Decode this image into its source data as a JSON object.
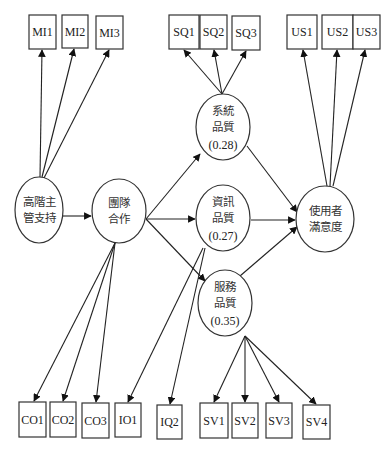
{
  "diagram": {
    "width": 390,
    "height": 453,
    "colors": {
      "stroke": "#333333",
      "text": "#222222",
      "background": "#ffffff"
    },
    "observed": [
      {
        "id": "MI1",
        "label": "MI1",
        "x": 29,
        "y": 15,
        "w": 27,
        "h": 34
      },
      {
        "id": "MI2",
        "label": "MI2",
        "x": 62,
        "y": 15,
        "w": 26,
        "h": 33
      },
      {
        "id": "MI3",
        "label": "MI3",
        "x": 96,
        "y": 16,
        "w": 27,
        "h": 33
      },
      {
        "id": "SQ1",
        "label": "SQ1",
        "x": 169,
        "y": 15,
        "w": 30,
        "h": 34
      },
      {
        "id": "SQ2",
        "label": "SQ2",
        "x": 200,
        "y": 15,
        "w": 27,
        "h": 34
      },
      {
        "id": "SQ3",
        "label": "SQ3",
        "x": 232,
        "y": 16,
        "w": 28,
        "h": 34
      },
      {
        "id": "US1",
        "label": "US1",
        "x": 287,
        "y": 15,
        "w": 30,
        "h": 34
      },
      {
        "id": "US2",
        "label": "US2",
        "x": 322,
        "y": 15,
        "w": 31,
        "h": 34
      },
      {
        "id": "US3",
        "label": "US3",
        "x": 353,
        "y": 15,
        "w": 27,
        "h": 34
      },
      {
        "id": "CO1",
        "label": "CO1",
        "x": 19,
        "y": 402,
        "w": 27,
        "h": 35
      },
      {
        "id": "CO2",
        "label": "CO2",
        "x": 50,
        "y": 402,
        "w": 26,
        "h": 35
      },
      {
        "id": "CO3",
        "label": "CO3",
        "x": 82,
        "y": 403,
        "w": 27,
        "h": 35
      },
      {
        "id": "IO1",
        "label": "IO1",
        "x": 115,
        "y": 403,
        "w": 26,
        "h": 34
      },
      {
        "id": "IQ2",
        "label": "IQ2",
        "x": 157,
        "y": 405,
        "w": 25,
        "h": 34
      },
      {
        "id": "SV1",
        "label": "SV1",
        "x": 200,
        "y": 403,
        "w": 28,
        "h": 35
      },
      {
        "id": "SV2",
        "label": "SV2",
        "x": 232,
        "y": 403,
        "w": 26,
        "h": 35
      },
      {
        "id": "SV3",
        "label": "SV3",
        "x": 266,
        "y": 403,
        "w": 26,
        "h": 35
      },
      {
        "id": "SV4",
        "label": "SV4",
        "x": 303,
        "y": 405,
        "w": 27,
        "h": 34
      }
    ],
    "latent": [
      {
        "id": "top_mgmt",
        "lines": [
          "高階主",
          "管支持"
        ],
        "coef": "",
        "cx": 39,
        "cy": 210,
        "rx": 24,
        "ry": 33
      },
      {
        "id": "teamwork",
        "lines": [
          "團隊",
          "合作"
        ],
        "coef": "",
        "cx": 119,
        "cy": 211,
        "rx": 27,
        "ry": 32
      },
      {
        "id": "sys_quality",
        "lines": [
          "系統",
          "品質"
        ],
        "coef": "(0.28)",
        "cx": 223,
        "cy": 127,
        "rx": 27,
        "ry": 33
      },
      {
        "id": "info_quality",
        "lines": [
          "資訊",
          "品質"
        ],
        "coef": "(0.27)",
        "cx": 223,
        "cy": 218,
        "rx": 27,
        "ry": 33
      },
      {
        "id": "svc_quality",
        "lines": [
          "服務",
          "品質"
        ],
        "coef": "(0.35)",
        "cx": 225,
        "cy": 303,
        "rx": 27,
        "ry": 33
      },
      {
        "id": "user_sat",
        "lines": [
          "使用者",
          "滿意度"
        ],
        "coef": "",
        "cx": 325,
        "cy": 219,
        "rx": 29,
        "ry": 33
      }
    ],
    "edges": [
      {
        "from": "top_mgmt",
        "to": "MI1",
        "x1": 40,
        "y1": 177,
        "x2": 42,
        "y2": 50
      },
      {
        "from": "top_mgmt",
        "to": "MI2",
        "x1": 42,
        "y1": 177,
        "x2": 74,
        "y2": 49
      },
      {
        "from": "top_mgmt",
        "to": "MI3",
        "x1": 44,
        "y1": 178,
        "x2": 109,
        "y2": 50
      },
      {
        "from": "top_mgmt",
        "to": "teamwork",
        "x1": 63,
        "y1": 216,
        "x2": 91,
        "y2": 216
      },
      {
        "from": "teamwork",
        "to": "sys_quality",
        "x1": 146,
        "y1": 219,
        "x2": 200,
        "y2": 154
      },
      {
        "from": "teamwork",
        "to": "info_quality",
        "x1": 146,
        "y1": 219,
        "x2": 195,
        "y2": 219
      },
      {
        "from": "teamwork",
        "to": "svc_quality",
        "x1": 146,
        "y1": 219,
        "x2": 205,
        "y2": 281
      },
      {
        "from": "teamwork",
        "to": "CO1",
        "x1": 115,
        "y1": 243,
        "x2": 34,
        "y2": 401
      },
      {
        "from": "teamwork",
        "to": "CO2",
        "x1": 115,
        "y1": 243,
        "x2": 63,
        "y2": 401
      },
      {
        "from": "teamwork",
        "to": "CO3",
        "x1": 115,
        "y1": 243,
        "x2": 96,
        "y2": 402
      },
      {
        "from": "info_quality",
        "to": "IO1",
        "x1": 203,
        "y1": 248,
        "x2": 128,
        "y2": 402
      },
      {
        "from": "info_quality",
        "to": "IQ2",
        "x1": 205,
        "y1": 248,
        "x2": 170,
        "y2": 404
      },
      {
        "from": "sys_quality",
        "to": "SQ1",
        "x1": 222,
        "y1": 94,
        "x2": 184,
        "y2": 50
      },
      {
        "from": "sys_quality",
        "to": "SQ2",
        "x1": 222,
        "y1": 94,
        "x2": 214,
        "y2": 50
      },
      {
        "from": "sys_quality",
        "to": "SQ3",
        "x1": 222,
        "y1": 94,
        "x2": 246,
        "y2": 51
      },
      {
        "from": "sys_quality",
        "to": "user_sat",
        "x1": 247,
        "y1": 146,
        "x2": 297,
        "y2": 212
      },
      {
        "from": "info_quality",
        "to": "user_sat",
        "x1": 251,
        "y1": 220,
        "x2": 295,
        "y2": 220
      },
      {
        "from": "svc_quality",
        "to": "user_sat",
        "x1": 240,
        "y1": 276,
        "x2": 297,
        "y2": 227
      },
      {
        "from": "user_sat",
        "to": "US1",
        "x1": 327,
        "y1": 186,
        "x2": 303,
        "y2": 50
      },
      {
        "from": "user_sat",
        "to": "US2",
        "x1": 330,
        "y1": 186,
        "x2": 337,
        "y2": 50
      },
      {
        "from": "user_sat",
        "to": "US3",
        "x1": 333,
        "y1": 186,
        "x2": 365,
        "y2": 50
      },
      {
        "from": "svc_quality",
        "to": "SV1",
        "x1": 245,
        "y1": 336,
        "x2": 214,
        "y2": 402
      },
      {
        "from": "svc_quality",
        "to": "SV2",
        "x1": 245,
        "y1": 336,
        "x2": 245,
        "y2": 402
      },
      {
        "from": "svc_quality",
        "to": "SV3",
        "x1": 245,
        "y1": 336,
        "x2": 279,
        "y2": 402
      },
      {
        "from": "svc_quality",
        "to": "SV4",
        "x1": 245,
        "y1": 336,
        "x2": 316,
        "y2": 404
      }
    ]
  }
}
